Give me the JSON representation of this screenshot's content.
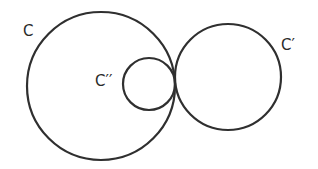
{
  "diagram": {
    "stroke_color": "#2f2f2f",
    "background": "#ffffff",
    "circles": [
      {
        "id": "C",
        "label": "C",
        "cx": 101,
        "cy": 86,
        "r": 74
      },
      {
        "id": "C-prime",
        "label": "C′",
        "cx": 228,
        "cy": 77,
        "r": 53
      },
      {
        "id": "C-double-prime",
        "label": "C′′",
        "cx": 149,
        "cy": 84,
        "r": 26
      }
    ],
    "labels": {
      "c": "C",
      "c_prime": "C′",
      "c_double_prime": "C′′"
    }
  }
}
